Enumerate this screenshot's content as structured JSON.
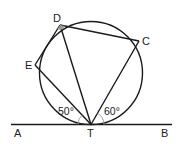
{
  "diagram": {
    "type": "geometry-circle-tangent",
    "colors": {
      "stroke": "#1a1a1a",
      "angle_marker": "#999999",
      "text": "#222222",
      "background": "#ffffff"
    },
    "points": {
      "D": {
        "label": "D"
      },
      "C": {
        "label": "C"
      },
      "E": {
        "label": "E"
      },
      "T": {
        "label": "T"
      },
      "A": {
        "label": "A"
      },
      "B": {
        "label": "B"
      }
    },
    "angles": {
      "ATE": {
        "label": "50°",
        "value": 50
      },
      "BTC": {
        "label": "60°",
        "value": 60
      }
    },
    "segments": [
      "DC",
      "CT",
      "DT",
      "DE",
      "ET",
      "AB"
    ],
    "circle": {
      "passes_through": [
        "D",
        "C",
        "T",
        "E"
      ],
      "tangent_at": "T"
    }
  }
}
